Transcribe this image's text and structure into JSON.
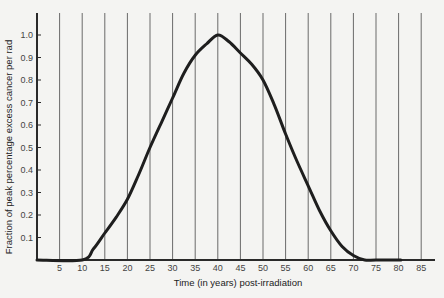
{
  "chart_data": {
    "type": "line",
    "title": "",
    "xlabel": "Time (in years) post-irradiation",
    "ylabel": "Fraction of peak percentage excess cancer per rad",
    "xlim": [
      0,
      85
    ],
    "ylim": [
      0,
      1.0
    ],
    "x_ticks": [
      5,
      10,
      15,
      20,
      25,
      30,
      35,
      40,
      45,
      50,
      55,
      60,
      65,
      70,
      75,
      80,
      85
    ],
    "x_tick_labels": [
      "5",
      "10",
      "15",
      "20",
      "25",
      "30",
      "35",
      "40",
      "45",
      "50",
      "55",
      "60",
      "65",
      "70",
      "75",
      "80",
      "85"
    ],
    "y_ticks": [
      0.1,
      0.2,
      0.3,
      0.4,
      0.5,
      0.6,
      0.7,
      0.8,
      0.9,
      1.0
    ],
    "y_tick_labels": [
      "0.1",
      "0.2",
      "0.3",
      "0.4",
      "0.5",
      "0.6",
      "0.7",
      "0.8",
      "0.9",
      "1.0"
    ],
    "grid": {
      "vertical": true,
      "horizontal": false
    },
    "legend": null,
    "series": [
      {
        "name": "Fraction of peak excess cancer per rad",
        "x": [
          0,
          10,
          12.5,
          15,
          17.5,
          20,
          22.5,
          25,
          27.5,
          30,
          32.5,
          35,
          37.5,
          40,
          42.5,
          45,
          47.5,
          50,
          52.5,
          55,
          57.5,
          60,
          62.5,
          65,
          67.5,
          70,
          72.5,
          75,
          80.5
        ],
        "y": [
          0,
          0,
          0.05,
          0.12,
          0.19,
          0.27,
          0.38,
          0.5,
          0.61,
          0.72,
          0.83,
          0.91,
          0.96,
          1.0,
          0.97,
          0.92,
          0.87,
          0.8,
          0.69,
          0.56,
          0.44,
          0.33,
          0.22,
          0.13,
          0.06,
          0.02,
          0.0,
          0.0,
          0.0
        ]
      }
    ]
  }
}
